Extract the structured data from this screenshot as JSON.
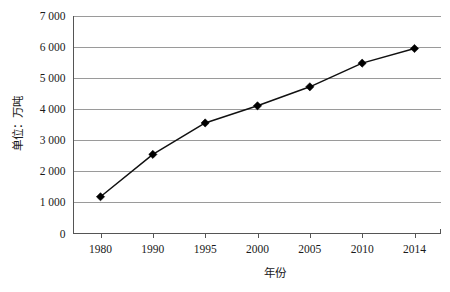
{
  "chart_data": {
    "type": "line",
    "title": "",
    "xlabel": "年份",
    "ylabel": "单位：万吨",
    "categories": [
      "1980",
      "1990",
      "1995",
      "2000",
      "2005",
      "2010",
      "2014"
    ],
    "values": [
      1180,
      2540,
      3550,
      4100,
      4710,
      5470,
      5940
    ],
    "series": [
      {
        "name": "",
        "values": [
          1180,
          2540,
          3550,
          4100,
          4710,
          5470,
          5940
        ]
      }
    ],
    "ylim": [
      0,
      7000
    ],
    "ytick_labels": [
      "0",
      "1 000",
      "2 000",
      "3 000",
      "4 000",
      "5 000",
      "6 000",
      "7 000"
    ],
    "ytick_values": [
      0,
      1000,
      2000,
      3000,
      4000,
      5000,
      6000,
      7000
    ],
    "xtick_labels": [
      "1980",
      "1990",
      "1995",
      "2000",
      "2005",
      "2010",
      "2014"
    ],
    "grid": "horizontal",
    "legend": "none",
    "marker": "diamond",
    "line_color": "#111111",
    "marker_color": "#000000",
    "grid_color": "#9a9a9a",
    "axis_color": "#555555",
    "background": "#ffffff"
  }
}
